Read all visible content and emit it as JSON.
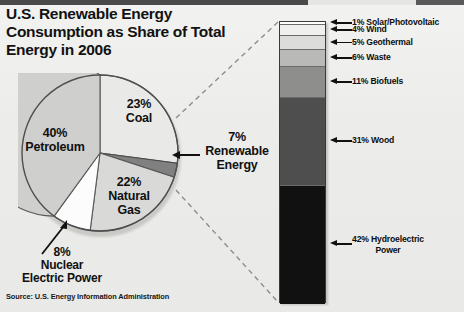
{
  "title": "U.S. Renewable Energy Consumption as Share of Total Energy in 2006",
  "source": "Source: U.S. Energy Information Administration",
  "pie_labels": {
    "coal": "23%\nCoal",
    "coal_pct": "23%",
    "coal_name": "Coal",
    "petroleum_pct": "40%",
    "petroleum_name": "Petroleum",
    "gas_pct": "22%",
    "gas_name": "Natural\nGas",
    "nuclear_pct": "8%",
    "nuclear_name": "Nuclear\nElectric Power",
    "renewable_pct": "7%",
    "renewable_name": "Renewable\nEnergy"
  },
  "chart_data": [
    {
      "type": "pie",
      "title": "U.S. Renewable Energy Consumption as Share of Total Energy in 2006",
      "categories": [
        "Coal",
        "Renewable Energy",
        "Natural Gas",
        "Nuclear Electric Power",
        "Petroleum"
      ],
      "values": [
        23,
        7,
        22,
        8,
        40
      ],
      "labels": [
        "23% Coal",
        "7% Renewable Energy",
        "22% Natural Gas",
        "8% Nuclear Electric Power",
        "40% Petroleum"
      ],
      "colors": [
        "#e9e9e7",
        "#808080",
        "#d9d9d7",
        "#fcfcfc",
        "#cfcfcd"
      ],
      "units": "percent of total energy",
      "legend": "none",
      "grid": false
    },
    {
      "type": "bar",
      "subtype": "stacked-single-column",
      "title": "Renewable Energy breakdown",
      "categories": [
        "Solar/Photovoltaic",
        "Wind",
        "Geothermal",
        "Waste",
        "Biofuels",
        "Wood",
        "Hydroelectric Power"
      ],
      "values": [
        1,
        4,
        5,
        6,
        11,
        31,
        42
      ],
      "labels": [
        "1% Solar/Photovoltaic",
        "4% Wind",
        "5% Geothermal",
        "6% Waste",
        "11% Biofuels",
        "31% Wood",
        "42% Hydroelectric Power"
      ],
      "colors": [
        "#ffffff",
        "#f0f0ee",
        "#dcdcda",
        "#b9b9b7",
        "#8e8e8c",
        "#4e4e4e",
        "#111111"
      ],
      "units": "percent of renewable energy",
      "ylim": [
        0,
        100
      ],
      "legend": "right callouts",
      "grid": false
    }
  ],
  "bar_segments": [
    {
      "label": "1% Solar/Photovoltaic",
      "pct": 1,
      "color": "#ffffff",
      "label_two_line": false
    },
    {
      "label": "4% Wind",
      "pct": 4,
      "color": "#f0f0ee",
      "label_two_line": false
    },
    {
      "label": "5% Geothermal",
      "pct": 5,
      "color": "#dcdcda",
      "label_two_line": false
    },
    {
      "label": "6% Waste",
      "pct": 6,
      "color": "#b9b9b7",
      "label_two_line": false
    },
    {
      "label": "11% Biofuels",
      "pct": 11,
      "color": "#8e8e8c",
      "label_two_line": false
    },
    {
      "label": "31% Wood",
      "pct": 31,
      "color": "#4e4e4e",
      "label_two_line": false
    },
    {
      "label": "42% Hydroelectric",
      "label2": "Power",
      "pct": 42,
      "color": "#111111",
      "label_two_line": true
    }
  ]
}
